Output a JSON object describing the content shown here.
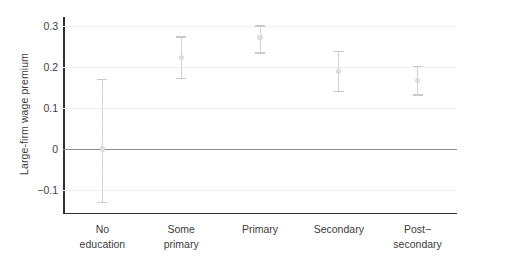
{
  "chart_data": {
    "type": "scatter",
    "title": "",
    "subtitle": "",
    "xlabel": "",
    "ylabel": "Large-firm wage premium",
    "categories": [
      "No\neducation",
      "Some\nprimary",
      "Primary",
      "Secondary",
      "Post−\nsecondary"
    ],
    "category_labels_flat": [
      "No education",
      "Some primary",
      "Primary",
      "Secondary",
      "Post−secondary"
    ],
    "values": [
      0.001,
      0.224,
      0.272,
      0.189,
      0.168
    ],
    "ci_low": [
      -0.128,
      0.174,
      0.236,
      0.143,
      0.134
    ],
    "ci_high": [
      0.172,
      0.275,
      0.302,
      0.24,
      0.204
    ],
    "ylim": [
      -0.155,
      0.32
    ],
    "yticks": [
      0.3,
      0.2,
      0.1,
      0,
      -0.1
    ],
    "ytick_labels": [
      "0.3",
      "0.2",
      "0.1",
      "0",
      "−0.1"
    ],
    "zero_reference_line": 0,
    "grid": "horizontal",
    "legend": "none",
    "errorbar_style": "dotted-vertical-with-caps",
    "colors": {
      "axis": "#2f2f2f",
      "gridline": "#f1f1f1",
      "zero_line": "#8e8e8e",
      "errorbar": "#cfcfcf",
      "point": "#e2e2e2",
      "text": "#3c3c3c",
      "background": "#ffffff"
    }
  }
}
